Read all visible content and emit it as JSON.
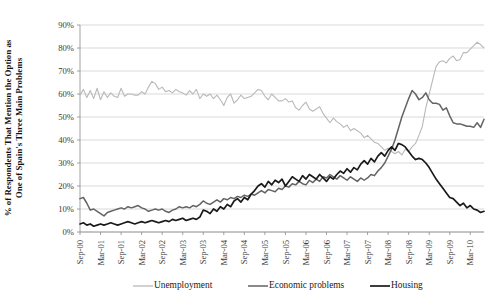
{
  "chart_data": {
    "type": "line",
    "title": "",
    "xlabel": "",
    "ylabel": "% of Respondents That Mention the Option as One of Spain's Three Main Problems",
    "ylim": [
      0,
      90
    ],
    "yticks": [
      0,
      10,
      20,
      30,
      40,
      50,
      60,
      70,
      80,
      90
    ],
    "ytick_labels": [
      "0%",
      "10%",
      "20%",
      "30%",
      "40%",
      "50%",
      "60%",
      "70%",
      "80%",
      "90%"
    ],
    "grid": true,
    "legend_position": "bottom",
    "x_start": "Sep-00",
    "x_end": "Mar-10",
    "x_step_months": 1,
    "xtick_labels": [
      "Sep-00",
      "Mar-01",
      "Sep-01",
      "Mar-02",
      "Sep-02",
      "Mar-03",
      "Sep-03",
      "Mar-04",
      "Sep-04",
      "Mar-05",
      "Sep-05",
      "Mar-06",
      "Sep-06",
      "Mar-07",
      "Sep-07",
      "Mar-08",
      "Sep-08",
      "Mar-09",
      "Sep-09",
      "Mar-10"
    ],
    "xtick_step": 6,
    "series": [
      {
        "name": "Unemployment",
        "color": "#b9b9b9",
        "width": 1.1,
        "values": [
          59.5,
          62.0,
          58.5,
          61.5,
          58.0,
          62.5,
          57.5,
          61.0,
          58.5,
          60.5,
          59.0,
          58.5,
          62.5,
          59.0,
          60.0,
          60.0,
          59.5,
          59.5,
          61.0,
          60.0,
          63.0,
          65.5,
          64.5,
          62.0,
          63.0,
          61.0,
          61.5,
          60.5,
          62.0,
          61.0,
          60.5,
          59.5,
          61.5,
          60.0,
          62.0,
          58.0,
          60.0,
          59.0,
          60.0,
          58.0,
          59.5,
          57.5,
          55.0,
          58.5,
          60.0,
          56.0,
          57.5,
          59.5,
          58.0,
          58.5,
          59.0,
          60.5,
          62.0,
          61.5,
          59.0,
          57.5,
          60.0,
          58.5,
          57.0,
          57.0,
          58.0,
          56.5,
          57.0,
          54.0,
          53.0,
          55.0,
          56.5,
          53.5,
          52.5,
          53.5,
          54.5,
          51.5,
          49.5,
          47.5,
          49.5,
          48.0,
          47.0,
          45.5,
          46.5,
          44.0,
          45.0,
          44.0,
          43.0,
          41.0,
          42.0,
          40.5,
          39.0,
          38.5,
          37.0,
          35.5,
          36.5,
          35.0,
          34.0,
          35.0,
          33.5,
          36.0,
          35.0,
          37.0,
          38.5,
          42.0,
          46.0,
          54.0,
          60.0,
          66.0,
          72.0,
          74.0,
          74.5,
          73.5,
          75.5,
          76.5,
          74.5,
          75.0,
          78.0,
          78.0,
          79.5,
          81.0,
          82.5,
          81.5,
          80.0
        ]
      },
      {
        "name": "Economic problems",
        "color": "#636363",
        "width": 1.5,
        "values": [
          14.5,
          15.0,
          12.5,
          9.5,
          10.0,
          9.0,
          8.0,
          7.0,
          8.5,
          9.0,
          9.5,
          10.0,
          10.5,
          10.0,
          11.0,
          10.5,
          11.0,
          11.5,
          10.5,
          10.0,
          9.0,
          9.5,
          10.0,
          9.5,
          10.0,
          9.0,
          8.5,
          9.5,
          10.0,
          11.0,
          10.5,
          11.0,
          10.5,
          11.5,
          11.0,
          12.0,
          13.5,
          12.5,
          12.0,
          13.0,
          14.0,
          13.0,
          14.5,
          14.0,
          15.0,
          14.5,
          15.5,
          15.0,
          16.0,
          15.5,
          16.5,
          16.0,
          17.0,
          18.0,
          17.0,
          18.5,
          18.0,
          17.5,
          19.0,
          18.5,
          20.0,
          19.5,
          21.0,
          20.5,
          22.0,
          21.0,
          20.5,
          22.5,
          21.5,
          23.0,
          22.0,
          24.0,
          23.5,
          25.0,
          24.0,
          23.0,
          24.5,
          23.5,
          22.5,
          24.0,
          23.0,
          22.0,
          23.5,
          22.5,
          23.5,
          25.0,
          24.5,
          26.5,
          28.0,
          30.0,
          33.0,
          36.0,
          40.0,
          45.0,
          50.0,
          54.0,
          58.0,
          61.5,
          60.0,
          57.5,
          58.5,
          60.5,
          57.5,
          56.0,
          56.0,
          55.5,
          53.0,
          54.0,
          50.5,
          47.5,
          47.0,
          47.0,
          46.5,
          46.0,
          46.0,
          45.5,
          47.5,
          45.5,
          49.0
        ]
      },
      {
        "name": "Housing",
        "color": "#1a1a1a",
        "width": 1.7,
        "values": [
          3.5,
          4.0,
          3.0,
          3.5,
          2.5,
          3.0,
          3.5,
          3.0,
          3.5,
          4.0,
          3.5,
          3.0,
          3.5,
          4.0,
          4.5,
          4.0,
          3.5,
          4.0,
          4.5,
          4.0,
          4.5,
          5.0,
          4.5,
          4.0,
          4.5,
          5.0,
          4.5,
          5.5,
          5.0,
          5.5,
          6.0,
          5.0,
          5.5,
          6.0,
          5.5,
          6.5,
          9.5,
          9.0,
          8.0,
          10.0,
          9.0,
          11.0,
          10.0,
          12.0,
          11.0,
          13.5,
          14.5,
          13.0,
          15.0,
          14.0,
          16.5,
          18.0,
          20.0,
          21.0,
          19.5,
          22.0,
          20.5,
          22.5,
          21.5,
          23.0,
          20.0,
          22.0,
          24.0,
          23.0,
          22.0,
          24.5,
          23.0,
          25.0,
          24.0,
          23.0,
          25.0,
          23.5,
          22.0,
          24.0,
          23.0,
          25.0,
          26.5,
          25.5,
          27.5,
          26.0,
          28.0,
          27.0,
          29.5,
          31.0,
          29.5,
          32.0,
          30.5,
          33.0,
          34.5,
          33.0,
          35.5,
          37.0,
          35.5,
          38.5,
          38.0,
          37.0,
          35.0,
          33.0,
          31.5,
          32.0,
          31.5,
          30.0,
          28.0,
          25.5,
          23.0,
          21.0,
          19.0,
          17.0,
          15.0,
          14.5,
          13.0,
          11.5,
          12.5,
          10.5,
          11.5,
          10.0,
          9.5,
          8.5,
          9.0
        ]
      }
    ]
  },
  "legend": {
    "items": [
      {
        "label": "Unemployment"
      },
      {
        "label": "Economic problems"
      },
      {
        "label": "Housing"
      }
    ]
  }
}
